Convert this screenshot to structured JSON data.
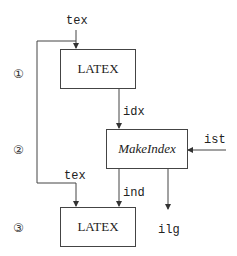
{
  "diagram": {
    "steps": [
      "①",
      "②",
      "③"
    ],
    "files": {
      "tex_in": "tex",
      "idx": "idx",
      "ist": "ist",
      "tex_loop": "tex",
      "ind": "ind",
      "ilg": "ilg"
    },
    "boxes": {
      "latex1": "LATEX",
      "makeindex": "MakeIndex",
      "latex2": "LATEX"
    }
  }
}
